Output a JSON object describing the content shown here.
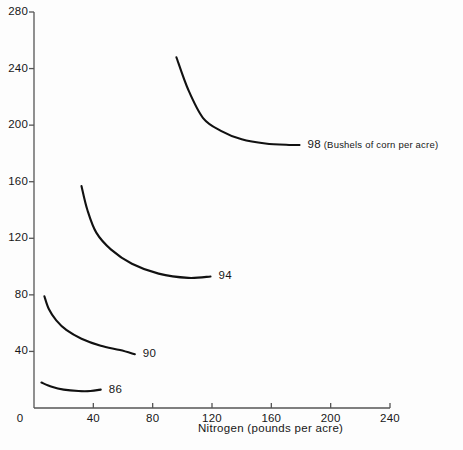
{
  "chart_data": {
    "type": "line",
    "title": "",
    "xlabel": "Nitrogen (pounds per acre)",
    "ylabel": "",
    "xlim": [
      0,
      240
    ],
    "ylim": [
      0,
      280
    ],
    "xticks": [
      "0",
      "40",
      "80",
      "120",
      "160",
      "200",
      "240"
    ],
    "yticks": [
      "0",
      "40",
      "80",
      "120",
      "160",
      "200",
      "240",
      "280"
    ],
    "grid": false,
    "legend_position": "inline-right-of-curve",
    "annotation_unit": "(Bushels of corn per acre)",
    "series": [
      {
        "name": "98",
        "label": "98",
        "unit_note": "(Bushels of corn per acre)",
        "x": [
          96,
          104,
          114,
          126,
          140,
          156,
          172,
          179
        ],
        "values": [
          248,
          225,
          205,
          196,
          190,
          187,
          186,
          186
        ]
      },
      {
        "name": "94",
        "label": "94",
        "unit_note": "",
        "x": [
          32,
          36,
          42,
          52,
          66,
          84,
          104,
          119
        ],
        "values": [
          157,
          140,
          124,
          112,
          102,
          95,
          92,
          93
        ]
      },
      {
        "name": "90",
        "label": "90",
        "unit_note": "",
        "x": [
          7,
          10,
          15,
          22,
          32,
          45,
          58,
          68
        ],
        "values": [
          79,
          70,
          62,
          55,
          49,
          44,
          41,
          38
        ]
      },
      {
        "name": "86",
        "label": "86",
        "unit_note": "",
        "x": [
          5,
          12,
          20,
          30,
          38,
          45
        ],
        "values": [
          18,
          15,
          13,
          12,
          12,
          13
        ]
      }
    ]
  },
  "axis_colors": {
    "axis_line": "#555555",
    "curve": "#111111",
    "text": "#171717"
  }
}
